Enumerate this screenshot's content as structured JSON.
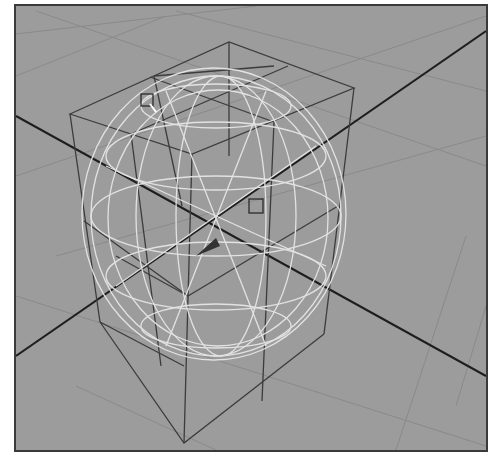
{
  "viewport": {
    "type": "3d-perspective-wireframe",
    "background_color": "#9c9c9c",
    "frame_color": "#3a3a3a",
    "grid_color": "#8a8a8a",
    "axis_color": "#1e1e1e",
    "cage_color": "#3c3c3c",
    "mesh_color": "#e6e6e6",
    "objects": [
      {
        "name": "lattice-cage",
        "kind": "box-wireframe",
        "divisions": 2
      },
      {
        "name": "deformed-sphere-mesh",
        "kind": "wireframe-mesh",
        "selected": true
      }
    ],
    "handles": [
      {
        "name": "lattice-point-handle",
        "x": 131,
        "y": 94
      },
      {
        "name": "pivot-handle",
        "x": 240,
        "y": 200
      }
    ]
  }
}
